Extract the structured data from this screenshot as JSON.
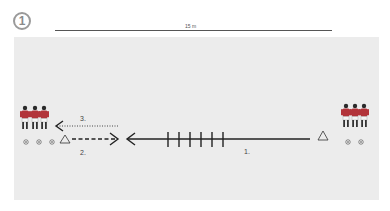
{
  "diagram": {
    "badge_number": "1",
    "distance_label": "15 m",
    "labels": {
      "run": "1.",
      "pass_back": "2.",
      "return": "3."
    },
    "elements": {
      "left_group": {
        "players": 3,
        "balls": 3
      },
      "right_group": {
        "players": 3,
        "balls": 2
      },
      "cones": 2,
      "hurdles": 6
    },
    "colors": {
      "field": "#ececec",
      "line": "#222222",
      "player_shirt": "#b2343a",
      "player_shorts": "#ffffff"
    }
  }
}
